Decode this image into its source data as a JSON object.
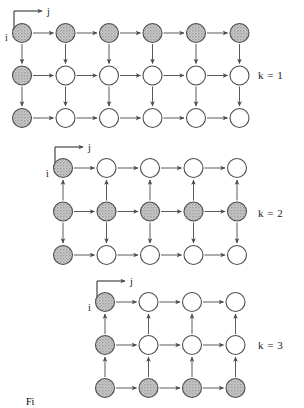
{
  "figure": {
    "caption_fragment": "Fi",
    "node_radius": 9.5,
    "colors": {
      "node_stroke": "#4d4d4d",
      "node_fill_empty": "#ffffff",
      "node_fill_shaded": "#b9b9b9",
      "arrow": "#5a5a5a",
      "text": "#1a1a1a"
    },
    "axis_indicator": {
      "horizontal_label": "j",
      "vertical_label": "i"
    },
    "panels": [
      {
        "id": "panel-k1",
        "label": "k = 1",
        "label_x": 258,
        "label_y": 79,
        "cols": 6,
        "rows": 3,
        "origin_x": 22,
        "origin_y": 33,
        "col_spacing": 43.5,
        "row_spacing": 42.5,
        "axis_x": 14,
        "axis_y": 11,
        "shaded_rows": [
          0
        ],
        "shaded_cols": [
          0
        ],
        "vertical_arrow_dirs": [
          "down",
          "down"
        ],
        "horizontal_arrow_dir": "right"
      },
      {
        "id": "panel-k2",
        "label": "k = 2",
        "label_x": 258,
        "label_y": 217,
        "cols": 5,
        "rows": 3,
        "origin_x": 63,
        "origin_y": 168,
        "col_spacing": 43.5,
        "row_spacing": 43.5,
        "axis_x": 55,
        "axis_y": 147,
        "shaded_rows": [
          1
        ],
        "shaded_cols": [
          0
        ],
        "vertical_arrow_dirs": [
          "up",
          "down"
        ],
        "horizontal_arrow_dir": "right"
      },
      {
        "id": "panel-k3",
        "label": "k = 3",
        "label_x": 258,
        "label_y": 349,
        "cols": 4,
        "rows": 3,
        "origin_x": 105,
        "origin_y": 302,
        "col_spacing": 43.5,
        "row_spacing": 43.0,
        "axis_x": 97,
        "axis_y": 281,
        "shaded_rows": [
          2
        ],
        "shaded_cols": [
          0
        ],
        "vertical_arrow_dirs": [
          "up",
          "up"
        ],
        "horizontal_arrow_dir": "right"
      }
    ]
  }
}
